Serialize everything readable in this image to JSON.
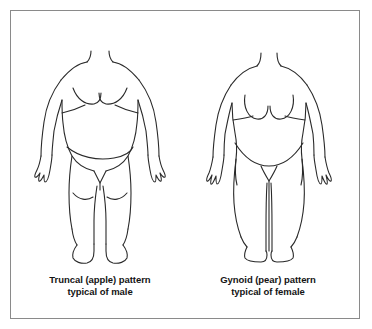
{
  "figure": {
    "title_hidden": "",
    "background_color": "#ffffff",
    "border_color": "#8a8a8a",
    "line_color": "#2a2a2a",
    "text_color": "#141414"
  },
  "panels": [
    {
      "id": "male",
      "illustration_name": "truncal-apple-body-outline",
      "illustration_alt": "Outline drawing of an obese male body with large central abdomen, arms at sides, legs apart; head cropped above the neck",
      "caption": {
        "line1": "Truncal (apple) pattern",
        "line2": "typical of male"
      }
    },
    {
      "id": "female",
      "illustration_name": "gynoid-pear-body-outline",
      "illustration_alt": "Outline drawing of an obese female body with wide hips and thighs, breasts, arms at sides, legs together; head cropped above the neck",
      "caption": {
        "line1": "Gynoid (pear) pattern",
        "line2": "typical of female"
      }
    }
  ]
}
